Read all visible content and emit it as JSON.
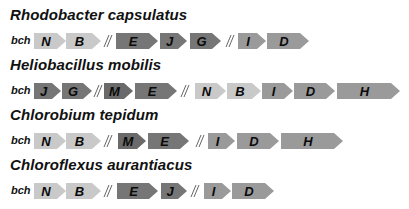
{
  "colors": {
    "light": "#c9c9c9",
    "medium": "#9a9a9a",
    "dark": "#767676",
    "darker": "#6a6a6a"
  },
  "gene_prefix": "bch",
  "organisms": [
    {
      "name": "Rhodobacter capsulatus",
      "cluster": [
        {
          "type": "gene",
          "label": "N",
          "shade": "light",
          "x": 34,
          "w": 32
        },
        {
          "type": "gene",
          "label": "B",
          "shade": "light",
          "x": 66,
          "w": 35
        },
        {
          "type": "break",
          "x": 103
        },
        {
          "type": "gene",
          "label": "E",
          "shade": "dark",
          "x": 116,
          "w": 42
        },
        {
          "type": "gene",
          "label": "J",
          "shade": "dark",
          "x": 160,
          "w": 27
        },
        {
          "type": "gene",
          "label": "G",
          "shade": "dark",
          "x": 190,
          "w": 31
        },
        {
          "type": "break",
          "x": 225
        },
        {
          "type": "gene",
          "label": "I",
          "shade": "medium",
          "x": 238,
          "w": 28
        },
        {
          "type": "gene",
          "label": "D",
          "shade": "medium",
          "x": 267,
          "w": 42
        }
      ]
    },
    {
      "name": "Heliobacillus mobilis",
      "cluster": [
        {
          "type": "gene",
          "label": "J",
          "shade": "dark",
          "x": 34,
          "w": 27
        },
        {
          "type": "gene",
          "label": "G",
          "shade": "dark",
          "x": 62,
          "w": 30
        },
        {
          "type": "break",
          "x": 93
        },
        {
          "type": "gene",
          "label": "M",
          "shade": "darker",
          "x": 104,
          "w": 29
        },
        {
          "type": "gene",
          "label": "E",
          "shade": "dark",
          "x": 135,
          "w": 42
        },
        {
          "type": "break",
          "x": 180
        },
        {
          "type": "gene",
          "label": "N",
          "shade": "light",
          "x": 195,
          "w": 31
        },
        {
          "type": "gene",
          "label": "B",
          "shade": "light",
          "x": 227,
          "w": 34
        },
        {
          "type": "gene",
          "label": "I",
          "shade": "medium",
          "x": 262,
          "w": 31
        },
        {
          "type": "gene",
          "label": "D",
          "shade": "medium",
          "x": 294,
          "w": 41
        },
        {
          "type": "gene",
          "label": "H",
          "shade": "medium",
          "x": 337,
          "w": 63
        }
      ]
    },
    {
      "name": "Chlorobium tepidum",
      "cluster": [
        {
          "type": "gene",
          "label": "N",
          "shade": "light",
          "x": 34,
          "w": 32
        },
        {
          "type": "gene",
          "label": "B",
          "shade": "light",
          "x": 66,
          "w": 35
        },
        {
          "type": "break",
          "x": 103
        },
        {
          "type": "gene",
          "label": "M",
          "shade": "darker",
          "x": 118,
          "w": 28
        },
        {
          "type": "gene",
          "label": "E",
          "shade": "dark",
          "x": 148,
          "w": 41
        },
        {
          "type": "break",
          "x": 195
        },
        {
          "type": "gene",
          "label": "I",
          "shade": "medium",
          "x": 208,
          "w": 27
        },
        {
          "type": "gene",
          "label": "D",
          "shade": "medium",
          "x": 237,
          "w": 42
        },
        {
          "type": "gene",
          "label": "H",
          "shade": "medium",
          "x": 281,
          "w": 62
        }
      ]
    },
    {
      "name": "Chloroflexus aurantiacus",
      "cluster": [
        {
          "type": "gene",
          "label": "N",
          "shade": "light",
          "x": 34,
          "w": 32
        },
        {
          "type": "gene",
          "label": "B",
          "shade": "light",
          "x": 66,
          "w": 35
        },
        {
          "type": "break",
          "x": 103
        },
        {
          "type": "gene",
          "label": "E",
          "shade": "dark",
          "x": 117,
          "w": 41
        },
        {
          "type": "gene",
          "label": "J",
          "shade": "dark",
          "x": 161,
          "w": 26
        },
        {
          "type": "break",
          "x": 190
        },
        {
          "type": "gene",
          "label": "I",
          "shade": "medium",
          "x": 204,
          "w": 27
        },
        {
          "type": "gene",
          "label": "D",
          "shade": "medium",
          "x": 232,
          "w": 42
        }
      ]
    }
  ]
}
